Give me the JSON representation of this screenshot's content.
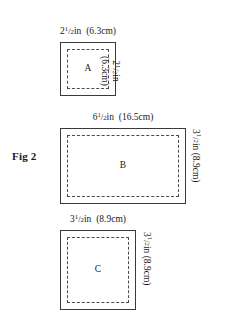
{
  "figure": {
    "caption": "Fig 2",
    "background_color": "#ffffff",
    "stroke_color": "#3a3a3a",
    "dash_color": "#4a4a4a"
  },
  "shapes": [
    {
      "label": "A",
      "name": "shape-a",
      "top_dimension": {
        "whole": "2",
        "numerator": "1",
        "denominator": "2",
        "unit": "in",
        "metric": "(6.3cm)",
        "full_text": "2½in (6.3cm)"
      },
      "right_dimension": {
        "whole": "2",
        "numerator": "1",
        "denominator": "2",
        "unit": "in",
        "metric": "(6.3cm)",
        "line1": "2½in",
        "line2": "(6.3cm)",
        "full_text": "2½in (6.3cm)"
      }
    },
    {
      "label": "B",
      "name": "shape-b",
      "top_dimension": {
        "whole": "6",
        "numerator": "1",
        "denominator": "2",
        "unit": "in",
        "metric": "(16.5cm)",
        "full_text": "6½in (16.5cm)"
      },
      "right_dimension": {
        "whole": "3",
        "numerator": "1",
        "denominator": "2",
        "unit": "in",
        "metric": "(8.9cm)",
        "full_text": "3½in (8.9cm)"
      }
    },
    {
      "label": "C",
      "name": "shape-c",
      "top_dimension": {
        "whole": "3",
        "numerator": "1",
        "denominator": "2",
        "unit": "in",
        "metric": "(8.9cm)",
        "full_text": "3½in (8.9cm)"
      },
      "right_dimension": {
        "whole": "3",
        "numerator": "1",
        "denominator": "2",
        "unit": "in",
        "metric": "(8.9cm)",
        "full_text": "3½in (8.9cm)"
      }
    }
  ]
}
